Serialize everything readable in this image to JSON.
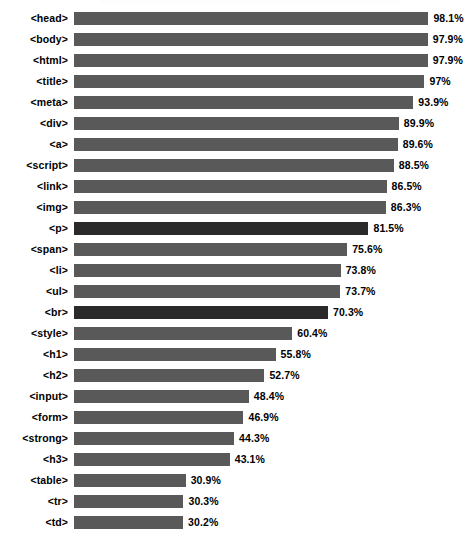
{
  "chart_data": {
    "type": "bar",
    "orientation": "horizontal",
    "title": "",
    "xlabel": "",
    "ylabel": "",
    "xlim": [
      0,
      100
    ],
    "grid": false,
    "legend": null,
    "value_suffix": "%",
    "categories": [
      "<head>",
      "<body>",
      "<html>",
      "<title>",
      "<meta>",
      "<div>",
      "<a>",
      "<script>",
      "<link>",
      "<img>",
      "<p>",
      "<span>",
      "<li>",
      "<ul>",
      "<br>",
      "<style>",
      "<h1>",
      "<h2>",
      "<input>",
      "<form>",
      "<strong>",
      "<h3>",
      "<table>",
      "<tr>",
      "<td>"
    ],
    "values": [
      98.1,
      97.9,
      97.9,
      97,
      93.9,
      89.9,
      89.6,
      88.5,
      86.5,
      86.3,
      81.5,
      75.6,
      73.8,
      73.7,
      70.3,
      60.4,
      55.8,
      52.7,
      48.4,
      46.9,
      44.3,
      43.1,
      30.9,
      30.3,
      30.2
    ],
    "value_labels": [
      "98.1%",
      "97.9%",
      "97.9%",
      "97%",
      "93.9%",
      "89.9%",
      "89.6%",
      "88.5%",
      "86.5%",
      "86.3%",
      "81.5%",
      "75.6%",
      "73.8%",
      "73.7%",
      "70.3%",
      "60.4%",
      "55.8%",
      "52.7%",
      "48.4%",
      "46.9%",
      "44.3%",
      "43.1%",
      "30.9%",
      "30.3%",
      "30.2%"
    ],
    "highlighted_indices": [
      10,
      14
    ],
    "colors": {
      "bar": "#595959",
      "bar_highlight": "#2a2a2a",
      "label": "#000000",
      "background": "#ffffff"
    }
  }
}
